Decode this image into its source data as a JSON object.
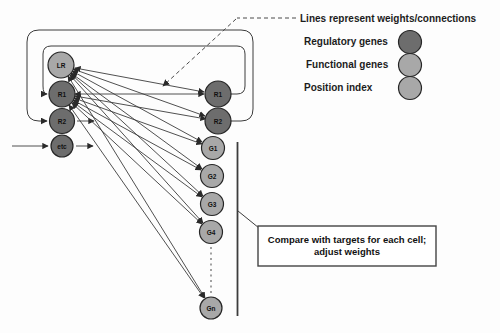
{
  "legend": {
    "title": "Lines represent weights/connections",
    "items": [
      {
        "label": "Regulatory genes"
      },
      {
        "label": "Functional genes"
      },
      {
        "label": "Position index"
      }
    ]
  },
  "callout": {
    "line1": "Compare with targets  for each cell;",
    "line2": "adjust weights"
  },
  "network": {
    "inputs": [
      {
        "label": "LR"
      },
      {
        "label": "R1"
      },
      {
        "label": "R2"
      },
      {
        "label": "etc"
      }
    ],
    "outputs": [
      {
        "label": "R1"
      },
      {
        "label": "R2"
      },
      {
        "label": "G1"
      },
      {
        "label": "G2"
      },
      {
        "label": "G3"
      },
      {
        "label": "G4"
      },
      {
        "label": "Gn"
      }
    ]
  },
  "colors": {
    "regulatory": "#6d6d6d",
    "functional": "#a8a8a8",
    "position_index": "#a8a8a8",
    "line": "#3c3c3c"
  }
}
